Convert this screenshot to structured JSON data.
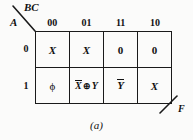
{
  "figure": {
    "caption": "(a)",
    "output_label": "F",
    "column_variables_label": "BC",
    "row_variable_label": "A",
    "line_color": "#1a1a1a",
    "background_color": "#fbfbfa"
  },
  "kmap": {
    "column_headers": [
      "00",
      "01",
      "11",
      "10"
    ],
    "row_headers": [
      "0",
      "1"
    ],
    "rows": [
      {
        "row_label": "0",
        "cells": [
          {
            "text": "X",
            "style": "italic"
          },
          {
            "text": "X",
            "style": "italic"
          },
          {
            "text": "0",
            "style": "plain"
          },
          {
            "text": "0",
            "style": "plain"
          }
        ]
      },
      {
        "row_label": "1",
        "cells": [
          {
            "text": "ϕ",
            "style": "phi"
          },
          {
            "text": "X̅ ⊕ Y",
            "style": "xor",
            "operand_left": "X",
            "operator": "⊕",
            "operand_right": "Y"
          },
          {
            "text": "Y̅",
            "style": "overbar",
            "operand": "Y"
          },
          {
            "text": "X",
            "style": "italic"
          }
        ]
      }
    ]
  }
}
